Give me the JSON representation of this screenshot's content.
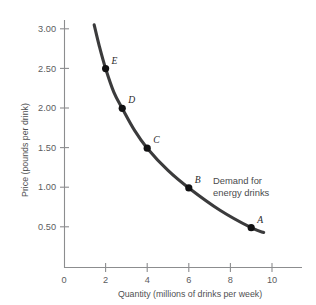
{
  "chart_data": {
    "type": "line",
    "title": "",
    "xlabel": "Quantity (millions of drinks per week)",
    "ylabel": "Price (pounds per drink)",
    "xlim": [
      0,
      11.2
    ],
    "ylim": [
      0,
      3.3
    ],
    "xticks": [
      "0",
      "2",
      "4",
      "6",
      "8",
      "10"
    ],
    "xtick_values": [
      0,
      2,
      4,
      6,
      8,
      10
    ],
    "yticks": [
      "0.50",
      "1.00",
      "1.50",
      "2.00",
      "2.50",
      "3.00"
    ],
    "ytick_values": [
      0.5,
      1.0,
      1.5,
      2.0,
      2.5,
      3.0
    ],
    "grid": false,
    "legend": "none",
    "series": [
      {
        "name": "Demand for energy drinks",
        "x": [
          1.45,
          1.7,
          2.0,
          2.4,
          2.8,
          3.4,
          4.0,
          5.0,
          6.0,
          7.5,
          9.0,
          9.6
        ],
        "y": [
          3.05,
          2.78,
          2.5,
          2.2,
          2.0,
          1.72,
          1.5,
          1.22,
          1.0,
          0.72,
          0.5,
          0.44
        ]
      }
    ],
    "points": [
      {
        "label": "A",
        "x": 9.0,
        "y": 0.5
      },
      {
        "label": "B",
        "x": 6.0,
        "y": 1.0
      },
      {
        "label": "C",
        "x": 4.0,
        "y": 1.5
      },
      {
        "label": "D",
        "x": 2.8,
        "y": 2.0
      },
      {
        "label": "E",
        "x": 2.0,
        "y": 2.5
      }
    ],
    "annotations": [
      {
        "name": "demand-curve-label",
        "line1": "Demand for",
        "line2": "energy drinks"
      }
    ],
    "colors": {
      "curve": "#3b3b3c",
      "point": "#111112",
      "axis": "#8c8d8f",
      "text": "#4f5052",
      "background": "#ffffff"
    }
  }
}
